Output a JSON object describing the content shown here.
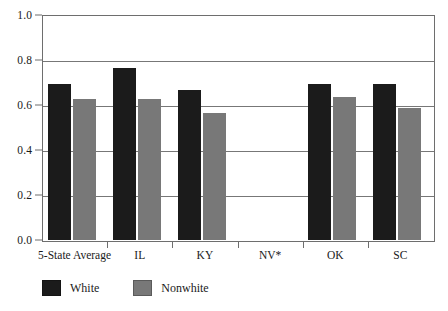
{
  "chart_data": {
    "type": "bar",
    "title": "",
    "subtitle": "",
    "xlabel": "",
    "ylabel": "",
    "ylim": [
      0.0,
      1.0
    ],
    "yticks": [
      "0.0",
      "0.2",
      "0.4",
      "0.6",
      "0.8",
      "1.0"
    ],
    "ytick_values": [
      0.0,
      0.2,
      0.4,
      0.6,
      0.8,
      1.0
    ],
    "grid": true,
    "legend_position": "bottom-left",
    "categories": [
      "5-State Average",
      "IL",
      "KY",
      "NV*",
      "OK",
      "SC"
    ],
    "series": [
      {
        "name": "White",
        "color": "#1b1b1b",
        "values": [
          0.7,
          0.77,
          0.67,
          null,
          0.7,
          0.7
        ]
      },
      {
        "name": "Nonwhite",
        "color": "#787878",
        "values": [
          0.63,
          0.63,
          0.57,
          null,
          0.64,
          0.59
        ]
      }
    ],
    "annotations": [
      "NV* has no data plotted"
    ]
  },
  "legend": {
    "entries": [
      {
        "label": "White",
        "swatch": "black-square-swatch"
      },
      {
        "label": "Nonwhite",
        "swatch": "gray-square-swatch"
      }
    ]
  },
  "colors": {
    "white_series": "#1b1b1b",
    "nonwhite_series": "#787878",
    "axis": "#6e6e6e",
    "grid": "#777777",
    "text": "#1a1a1a",
    "background": "#ffffff"
  }
}
